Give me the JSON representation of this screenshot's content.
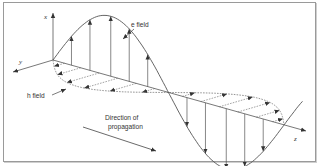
{
  "diagram": {
    "axes": {
      "x_label": "x",
      "y_label": "y",
      "z_label": "z"
    },
    "labels": {
      "e_field": "e field",
      "h_field": "h field",
      "direction_line1": "Direction of",
      "direction_line2": "propagation"
    },
    "colors": {
      "stroke": "#555555",
      "dashed": "#666666",
      "text": "#333333"
    },
    "e_field_arrow_count": 10,
    "h_field_arrow_count": 12
  }
}
